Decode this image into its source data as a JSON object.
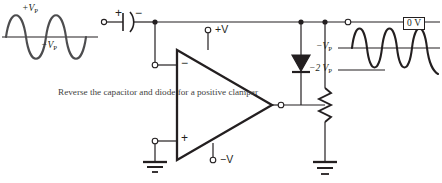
{
  "diagram": {
    "colors": {
      "wire": "#231f20",
      "waveform": "#4d4d4f",
      "baseline": "#231f20",
      "note_text": "#3f3f42",
      "background": "#ffffff"
    },
    "note": "Reverse the capacitor and diode for a positive clamper",
    "input_waveform": {
      "peak_positive_label": "+V",
      "peak_positive_sub": "P",
      "peak_negative_label": "−V",
      "peak_negative_sub": "P",
      "shape": "sine",
      "cycles": 1.5,
      "centered_on": "0 V"
    },
    "output_waveform": {
      "top_level_label": "0 V",
      "mid_level_label": "−V",
      "mid_level_sub": "P",
      "bottom_level_label": "−2 V",
      "bottom_level_sub": "P",
      "shape": "sine",
      "cycles": 2.25,
      "clamped_at": "0 V"
    },
    "components": {
      "capacitor": {
        "name": "capacitor",
        "plus_label": "+",
        "minus_label": "−",
        "type": "polarized"
      },
      "opamp": {
        "name": "operational amplifier",
        "inverting_input_label": "−",
        "noninverting_input_label": "+",
        "supply_positive_label": "+V",
        "supply_negative_label": "−V"
      },
      "diode": {
        "name": "diode",
        "orientation": "cathode-down"
      },
      "resistor": {
        "name": "resistor"
      },
      "grounds": [
        {
          "name": "ground-opamp-input"
        },
        {
          "name": "ground-output-resistor"
        }
      ],
      "terminals": [
        {
          "name": "input-terminal"
        },
        {
          "name": "inverting-input-terminal"
        },
        {
          "name": "noninverting-input-terminal"
        },
        {
          "name": "supply-positive-terminal"
        },
        {
          "name": "supply-negative-terminal"
        },
        {
          "name": "output-terminal"
        },
        {
          "name": "output-probe-terminal"
        },
        {
          "name": "diode-cathode-terminal"
        }
      ]
    }
  }
}
